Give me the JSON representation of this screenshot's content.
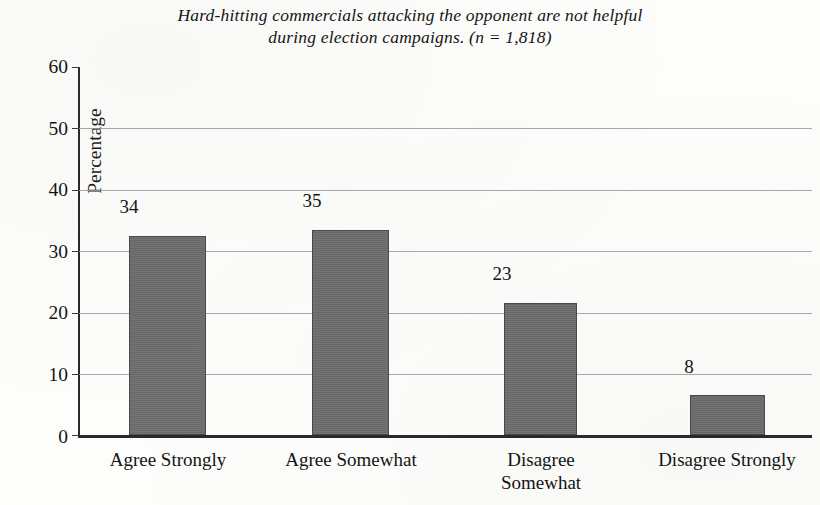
{
  "chart_data": {
    "type": "bar",
    "title": "Hard-hitting commercials attacking the opponent are not helpful during election campaigns. (n = 1,818)",
    "title_lines": [
      "Hard-hitting commercials attacking the opponent are not helpful",
      "during election campaigns. (n = 1,818)"
    ],
    "sample_size": "n = 1,818",
    "categories": [
      "Agree Strongly",
      "Agree Somewhat",
      "Disagree Somewhat",
      "Disagree Strongly"
    ],
    "category_lines": [
      [
        "Agree Strongly"
      ],
      [
        "Agree Somewhat"
      ],
      [
        "Disagree",
        "Somewhat"
      ],
      [
        "Disagree Strongly"
      ]
    ],
    "values": [
      34,
      35,
      23,
      8
    ],
    "value_labels": [
      "34",
      "35",
      "23",
      "8"
    ],
    "xlabel": "",
    "ylabel": "Percentage",
    "ylim": [
      0,
      60
    ],
    "ytick_labels": [
      "0",
      "10",
      "20",
      "30",
      "40",
      "50",
      "60"
    ],
    "ytick_values": [
      0,
      10,
      20,
      30,
      40,
      50,
      60
    ],
    "grid": true,
    "legend": false,
    "bar_color": "#6d6d6d",
    "bar_edge_color": "#4a4a4a",
    "axis_color": "#2a2a2a",
    "gridline_color": "#9a9a9a",
    "background_color": "#fdfdfb"
  }
}
